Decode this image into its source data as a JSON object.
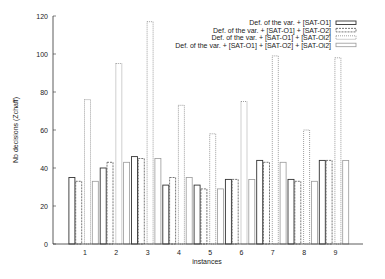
{
  "chart_data": {
    "type": "bar",
    "title": "",
    "xlabel": "instances",
    "ylabel": "Nb decisions (Zchaff)",
    "ylim": [
      0,
      120
    ],
    "yticks": [
      0,
      20,
      40,
      60,
      80,
      100,
      120
    ],
    "grid": false,
    "legend_position": "top-right",
    "categories": [
      "1",
      "2",
      "3",
      "4",
      "5",
      "6",
      "7",
      "8",
      "9"
    ],
    "series": [
      {
        "name": "Def. of the var. + [SAT-O1]",
        "style": "solid",
        "color": "#333333",
        "values": [
          35,
          40,
          46,
          31,
          31,
          34,
          44,
          34,
          44
        ]
      },
      {
        "name": "Def. of the var. + [SAT-O1] + [SAT-O2]",
        "style": "dashed",
        "color": "#555555",
        "values": [
          33,
          43,
          45,
          35,
          29,
          34,
          43,
          33,
          44
        ]
      },
      {
        "name": "Def. of the var. + [SAT-O1] + [SAT-Oi2]",
        "style": "dotted",
        "color": "#777777",
        "values": [
          76,
          95,
          117,
          73,
          58,
          75,
          99,
          60,
          98
        ]
      },
      {
        "name": "Def. of the var. + [SAT-O1] + [SAT-O2] + [SAT-Oi2]",
        "style": "light",
        "color": "#999999",
        "values": [
          33,
          43,
          45,
          35,
          29,
          34,
          43,
          33,
          44
        ]
      }
    ]
  }
}
